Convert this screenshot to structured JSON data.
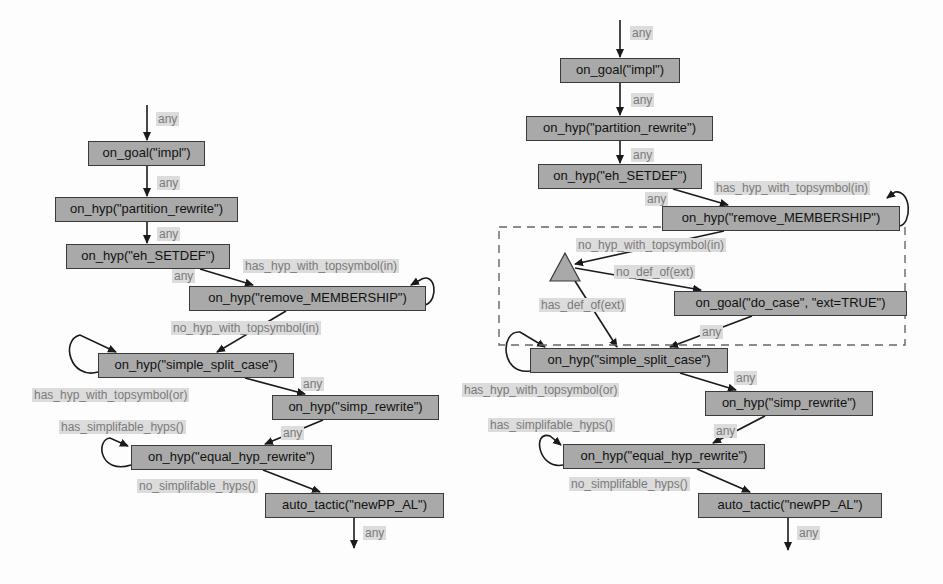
{
  "colors": {
    "node_fill": "#a9a9a9",
    "node_border": "#3a3a3a",
    "edge": "#1a1a1a",
    "label_bg": "#dcdcdc",
    "label_text": "#7a7a7a",
    "dashed_box": "#666666"
  },
  "left": {
    "nodes": [
      {
        "id": "goal_impl",
        "label": "on_goal(\"impl\")",
        "x": 88,
        "y": 141,
        "w": 117,
        "h": 25
      },
      {
        "id": "partition",
        "label": "on_hyp(\"partition_rewrite\")",
        "x": 55,
        "y": 197,
        "w": 183,
        "h": 25
      },
      {
        "id": "setdef",
        "label": "on_hyp(\"eh_SETDEF\")",
        "x": 66,
        "y": 244,
        "w": 164,
        "h": 25
      },
      {
        "id": "membership",
        "label": "on_hyp(\"remove_MEMBERSHIP\")",
        "x": 189,
        "y": 286,
        "w": 237,
        "h": 25
      },
      {
        "id": "split",
        "label": "on_hyp(\"simple_split_case\")",
        "x": 98,
        "y": 353,
        "w": 196,
        "h": 25
      },
      {
        "id": "simp",
        "label": "on_hyp(\"simp_rewrite\")",
        "x": 272,
        "y": 395,
        "w": 167,
        "h": 25
      },
      {
        "id": "equal",
        "label": "on_hyp(\"equal_hyp_rewrite\")",
        "x": 131,
        "y": 445,
        "w": 201,
        "h": 25
      },
      {
        "id": "auto",
        "label": "auto_tactic(\"newPP_AL\")",
        "x": 265,
        "y": 493,
        "w": 179,
        "h": 25
      }
    ],
    "edge_labels": [
      {
        "text": "any",
        "x": 156,
        "y": 112
      },
      {
        "text": "any",
        "x": 157,
        "y": 176
      },
      {
        "text": "any",
        "x": 157,
        "y": 227
      },
      {
        "text": "any",
        "x": 172,
        "y": 269
      },
      {
        "text": "has_hyp_with_topsymbol(in)",
        "x": 243,
        "y": 259
      },
      {
        "text": "no_hyp_with_topsymbol(in)",
        "x": 171,
        "y": 321
      },
      {
        "text": "has_hyp_with_topsymbol(or)",
        "x": 32,
        "y": 388
      },
      {
        "text": "any",
        "x": 301,
        "y": 377
      },
      {
        "text": "has_simplifable_hyps()",
        "x": 59,
        "y": 420
      },
      {
        "text": "any",
        "x": 281,
        "y": 426
      },
      {
        "text": "no_simplifable_hyps()",
        "x": 137,
        "y": 479
      },
      {
        "text": "any",
        "x": 363,
        "y": 526
      }
    ]
  },
  "right": {
    "nodes": [
      {
        "id": "goal_impl",
        "label": "on_goal(\"impl\")",
        "x": 560,
        "y": 58,
        "w": 120,
        "h": 25
      },
      {
        "id": "partition",
        "label": "on_hyp(\"partition_rewrite\")",
        "x": 526,
        "y": 116,
        "w": 187,
        "h": 25
      },
      {
        "id": "setdef",
        "label": "on_hyp(\"eh_SETDEF\")",
        "x": 538,
        "y": 164,
        "w": 164,
        "h": 25
      },
      {
        "id": "membership",
        "label": "on_hyp(\"remove_MEMBERSHIP\")",
        "x": 662,
        "y": 206,
        "w": 238,
        "h": 25
      },
      {
        "id": "do_case",
        "label": "on_goal(\"do_case\", \"ext=TRUE\")",
        "x": 674,
        "y": 291,
        "w": 233,
        "h": 25
      },
      {
        "id": "split",
        "label": "on_hyp(\"simple_split_case\")",
        "x": 530,
        "y": 348,
        "w": 198,
        "h": 25
      },
      {
        "id": "simp",
        "label": "on_hyp(\"simp_rewrite\")",
        "x": 705,
        "y": 391,
        "w": 168,
        "h": 25
      },
      {
        "id": "equal",
        "label": "on_hyp(\"equal_hyp_rewrite\")",
        "x": 563,
        "y": 444,
        "w": 202,
        "h": 25
      },
      {
        "id": "auto",
        "label": "auto_tactic(\"newPP_AL\")",
        "x": 698,
        "y": 493,
        "w": 184,
        "h": 25
      }
    ],
    "edge_labels": [
      {
        "text": "any",
        "x": 630,
        "y": 26
      },
      {
        "text": "any",
        "x": 631,
        "y": 93
      },
      {
        "text": "any",
        "x": 631,
        "y": 148
      },
      {
        "text": "any",
        "x": 645,
        "y": 192
      },
      {
        "text": "has_hyp_with_topsymbol(in)",
        "x": 714,
        "y": 181
      },
      {
        "text": "no_hyp_with_topsymbol(in)",
        "x": 576,
        "y": 238
      },
      {
        "text": "no_def_of(ext)",
        "x": 614,
        "y": 265
      },
      {
        "text": "has_def_of(ext)",
        "x": 539,
        "y": 298
      },
      {
        "text": "any",
        "x": 700,
        "y": 325
      },
      {
        "text": "any",
        "x": 734,
        "y": 371
      },
      {
        "text": "has_hyp_with_topsymbol(or)",
        "x": 462,
        "y": 383
      },
      {
        "text": "has_simplifable_hyps()",
        "x": 488,
        "y": 418
      },
      {
        "text": "any",
        "x": 714,
        "y": 424
      },
      {
        "text": "no_simplifable_hyps()",
        "x": 569,
        "y": 477
      },
      {
        "text": "any",
        "x": 797,
        "y": 526
      }
    ],
    "decision": {
      "label": "decision-triangle",
      "apex_x": 565,
      "apex_y": 253,
      "base_y": 281,
      "base_left": 550,
      "base_right": 580
    },
    "group_box": {
      "x": 499,
      "y": 227,
      "w": 406,
      "h": 118
    }
  }
}
